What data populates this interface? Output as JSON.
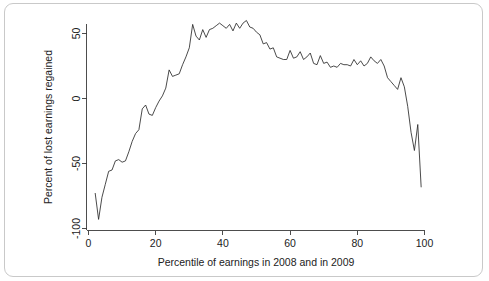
{
  "figure": {
    "background_color": "#ffffff",
    "frame_color": "#c9c9c9",
    "line_color": "#2b2b2b",
    "axis_color": "#3a3a3a"
  },
  "chart_data": {
    "type": "line",
    "title": "",
    "xlabel": "Percentile of earnings in 2008 and in 2009",
    "ylabel": "Percent of lost earnings regained",
    "xlim": [
      0,
      100
    ],
    "ylim": [
      -100,
      62
    ],
    "grid": false,
    "legend": null,
    "xticks": [
      0,
      20,
      40,
      60,
      80,
      100
    ],
    "xtick_labels": [
      "0",
      "20",
      "40",
      "60",
      "80",
      "100"
    ],
    "yticks": [
      50,
      0,
      -50,
      -100
    ],
    "ytick_labels": [
      "50",
      "0",
      "-50",
      "-100"
    ],
    "series": [
      {
        "name": "Percent of lost earnings regained",
        "x": [
          2,
          3,
          4,
          5,
          6,
          7,
          8,
          9,
          10,
          11,
          12,
          13,
          14,
          15,
          16,
          17,
          18,
          19,
          20,
          21,
          22,
          23,
          24,
          25,
          26,
          27,
          28,
          29,
          30,
          31,
          32,
          33,
          34,
          35,
          36,
          37,
          38,
          39,
          40,
          41,
          42,
          43,
          44,
          45,
          46,
          47,
          48,
          49,
          50,
          51,
          52,
          53,
          54,
          55,
          56,
          57,
          58,
          59,
          60,
          61,
          62,
          63,
          64,
          65,
          66,
          67,
          68,
          69,
          70,
          71,
          72,
          73,
          74,
          75,
          76,
          77,
          78,
          79,
          80,
          81,
          82,
          83,
          84,
          85,
          86,
          87,
          88,
          89,
          90,
          91,
          92,
          93,
          94,
          95,
          96,
          97,
          98,
          99
        ],
        "y": [
          -73,
          -93,
          -76,
          -66,
          -56,
          -55,
          -48,
          -47,
          -49,
          -48,
          -41,
          -33,
          -27,
          -24,
          -8,
          -5,
          -12,
          -13,
          -7,
          -2,
          2,
          8,
          22,
          17,
          18,
          19,
          26,
          32,
          39,
          57,
          48,
          45,
          53,
          47,
          53,
          54,
          56,
          58,
          56,
          54,
          57,
          52,
          58,
          54,
          58,
          60,
          55,
          54,
          51,
          49,
          42,
          43,
          38,
          39,
          32,
          31,
          30,
          30,
          37,
          31,
          32,
          36,
          30,
          32,
          35,
          27,
          26,
          33,
          27,
          28,
          24,
          25,
          24,
          27,
          26,
          26,
          25,
          30,
          26,
          29,
          25,
          27,
          32,
          29,
          27,
          30,
          25,
          16,
          13,
          10,
          7,
          16,
          9,
          -6,
          -26,
          -40,
          -20,
          -68
        ]
      }
    ]
  }
}
